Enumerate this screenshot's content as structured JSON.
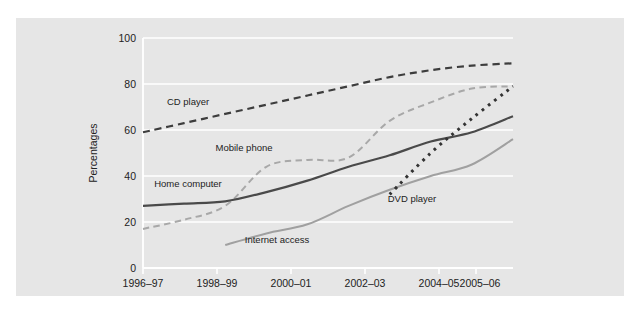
{
  "figure": {
    "background": "#ffffff",
    "panel_color": "#e6e6e6",
    "grid_color": "#ffffff"
  },
  "axis": {
    "y_title": "Percentages",
    "y_ticks": [
      "0",
      "20",
      "40",
      "60",
      "80",
      "100"
    ],
    "x_ticks": [
      "1996–97",
      "1998–99",
      "2000–01",
      "2002–03",
      "2004–05",
      "2005–06"
    ]
  },
  "labels": {
    "cd_player": "CD player",
    "mobile_phone": "Mobile phone",
    "home_computer": "Home computer",
    "internet_access": "Internet access",
    "dvd_player": "DVD player"
  },
  "chart_data": {
    "type": "line",
    "title": "",
    "xlabel": "",
    "ylabel": "Percentages",
    "ylim": [
      0,
      100
    ],
    "yticks": [
      0,
      20,
      40,
      60,
      80,
      100
    ],
    "grid": true,
    "legend": "inline-labels",
    "x": [
      "1996–97",
      "1997–98",
      "1998–99",
      "1999–00",
      "2000–01",
      "2001–02",
      "2002–03",
      "2003–04",
      "2004–05",
      "2005–06"
    ],
    "xtick_labels": [
      "1996–97",
      "1998–99",
      "2000–01",
      "2002–03",
      "2004–05",
      "2005–06"
    ],
    "series": [
      {
        "name": "CD player",
        "color": "#3d3d3d",
        "style": "dashed",
        "values": [
          59,
          63,
          67,
          71,
          75,
          79,
          83,
          86,
          88,
          89
        ]
      },
      {
        "name": "Mobile phone",
        "color": "#a8a8a8",
        "style": "dashed",
        "values": [
          17,
          21,
          27,
          44,
          47,
          48,
          64,
          72,
          78,
          79
        ]
      },
      {
        "name": "Home computer",
        "color": "#4a4a4a",
        "style": "solid",
        "values": [
          27,
          28,
          29,
          33,
          38,
          44,
          49,
          55,
          59,
          66
        ]
      },
      {
        "name": "Internet access",
        "color": "#a0a0a0",
        "style": "solid",
        "values": [
          null,
          null,
          10,
          15,
          19,
          27,
          34,
          40,
          45,
          56
        ]
      },
      {
        "name": "DVD player",
        "color": "#333333",
        "style": "dotted",
        "values": [
          null,
          null,
          null,
          null,
          null,
          null,
          32,
          50,
          65,
          79
        ]
      }
    ]
  }
}
